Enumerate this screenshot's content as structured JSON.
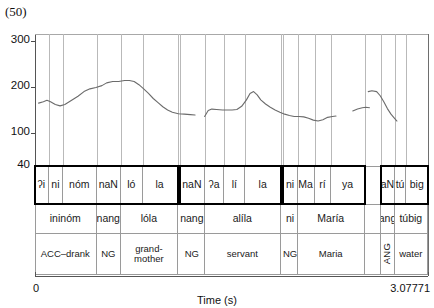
{
  "figure": {
    "example_number": "(50)",
    "x_axis_title": "Time (s)",
    "x_min_label": "0",
    "x_max_label": "3.07771",
    "y_ticks": [
      "300",
      "200",
      "100",
      "40"
    ],
    "grid": true,
    "line_color": "#6b6b6b"
  },
  "chart_data": {
    "type": "line",
    "title": "(50)",
    "xlabel": "Time (s)",
    "ylabel": "",
    "xlim": [
      0,
      3.07771
    ],
    "ylim": [
      40,
      300
    ],
    "yticks": [
      40,
      100,
      200,
      300
    ],
    "grid": "vertical gridlines at segment boundaries",
    "legend": "none",
    "series": [
      {
        "name": "F0 contour (Hz)",
        "points": [
          [
            0.03,
            165
          ],
          [
            0.07,
            168
          ],
          [
            0.1,
            171
          ],
          [
            0.13,
            168
          ],
          [
            0.17,
            162
          ],
          [
            0.21,
            159
          ],
          [
            0.25,
            162
          ],
          [
            0.3,
            170
          ],
          [
            0.36,
            180
          ],
          [
            0.41,
            190
          ],
          [
            0.46,
            196
          ],
          [
            0.51,
            199
          ],
          [
            0.56,
            203
          ],
          [
            0.6,
            209
          ],
          [
            0.65,
            212
          ],
          [
            0.7,
            212
          ],
          [
            0.75,
            214
          ],
          [
            0.79,
            214
          ],
          [
            0.83,
            212
          ],
          [
            0.87,
            205
          ],
          [
            0.91,
            196
          ],
          [
            0.95,
            186
          ],
          [
            0.99,
            175
          ],
          [
            1.03,
            166
          ],
          [
            1.07,
            157
          ],
          [
            1.11,
            150
          ],
          [
            1.15,
            145
          ],
          [
            1.2,
            142
          ],
          [
            1.25,
            141
          ],
          [
            1.3,
            140
          ],
          [
            1.34,
            139
          ]
        ]
      },
      {
        "name": "F0 contour segment 2 (Hz)",
        "points": [
          [
            1.42,
            136
          ],
          [
            1.45,
            149
          ],
          [
            1.48,
            152
          ],
          [
            1.52,
            151
          ],
          [
            1.57,
            150
          ],
          [
            1.61,
            150
          ],
          [
            1.65,
            150
          ],
          [
            1.69,
            151
          ],
          [
            1.73,
            158
          ],
          [
            1.77,
            172
          ],
          [
            1.8,
            186
          ],
          [
            1.83,
            190
          ],
          [
            1.86,
            183
          ],
          [
            1.89,
            172
          ],
          [
            1.93,
            163
          ],
          [
            1.97,
            156
          ],
          [
            2.01,
            150
          ],
          [
            2.05,
            145
          ],
          [
            2.09,
            141
          ],
          [
            2.13,
            138
          ],
          [
            2.17,
            136
          ],
          [
            2.21,
            136
          ],
          [
            2.25,
            135
          ],
          [
            2.29,
            132
          ],
          [
            2.33,
            128
          ],
          [
            2.37,
            126
          ],
          [
            2.41,
            129
          ],
          [
            2.45,
            134
          ],
          [
            2.49,
            136
          ],
          [
            2.52,
            137
          ]
        ]
      },
      {
        "name": "F0 contour segment 3 (Hz)",
        "points": [
          [
            2.66,
            148
          ],
          [
            2.7,
            152
          ],
          [
            2.74,
            155
          ],
          [
            2.77,
            156
          ],
          [
            2.8,
            155
          ]
        ]
      },
      {
        "name": "F0 contour segment 4 (Hz)",
        "points": [
          [
            2.79,
            190
          ],
          [
            2.82,
            192
          ],
          [
            2.86,
            190
          ],
          [
            2.89,
            181
          ],
          [
            2.92,
            168
          ],
          [
            2.95,
            153
          ],
          [
            2.98,
            141
          ],
          [
            3.01,
            132
          ],
          [
            3.03,
            126
          ]
        ]
      }
    ]
  },
  "tiers": {
    "syllables": [
      {
        "label": "ʔi",
        "start": 0.0,
        "end": 0.115,
        "bold": true
      },
      {
        "label": "ni",
        "start": 0.115,
        "end": 0.235,
        "bold": true
      },
      {
        "label": "nóm",
        "start": 0.235,
        "end": 0.515,
        "bold": true
      },
      {
        "label": "naN",
        "start": 0.515,
        "end": 0.72,
        "bold": true
      },
      {
        "label": "ló",
        "start": 0.72,
        "end": 0.9,
        "bold": true
      },
      {
        "label": "la",
        "start": 0.9,
        "end": 1.195,
        "bold": true
      },
      {
        "label": "naN",
        "start": 1.215,
        "end": 1.42,
        "bold": true
      },
      {
        "label": "ʔa",
        "start": 1.42,
        "end": 1.585,
        "bold": true
      },
      {
        "label": "lí",
        "start": 1.585,
        "end": 1.76,
        "bold": true
      },
      {
        "label": "la",
        "start": 1.76,
        "end": 2.06,
        "bold": true
      },
      {
        "label": "ni",
        "start": 2.08,
        "end": 2.2,
        "bold": true
      },
      {
        "label": "Ma",
        "start": 2.2,
        "end": 2.34,
        "bold": true
      },
      {
        "label": "rí",
        "start": 2.34,
        "end": 2.48,
        "bold": true
      },
      {
        "label": "ya",
        "start": 2.48,
        "end": 2.76,
        "bold": true
      },
      {
        "label": "",
        "start": 2.76,
        "end": 2.9,
        "bold": false
      },
      {
        "label": "aN",
        "start": 2.9,
        "end": 3.01,
        "bold": true
      },
      {
        "label": "tú",
        "start": 3.01,
        "end": 3.11,
        "bold": true
      },
      {
        "label": "big",
        "start": 3.11,
        "end": 3.29,
        "bold": true
      }
    ],
    "words": [
      {
        "label": "ininóm",
        "start": 0.0,
        "end": 0.515
      },
      {
        "label": "nang",
        "start": 0.515,
        "end": 0.72
      },
      {
        "label": "lóla",
        "start": 0.72,
        "end": 1.195
      },
      {
        "label": "nang",
        "start": 1.215,
        "end": 1.42
      },
      {
        "label": "alíla",
        "start": 1.42,
        "end": 2.06
      },
      {
        "label": "ni",
        "start": 2.08,
        "end": 2.2
      },
      {
        "label": "María",
        "start": 2.2,
        "end": 2.76
      },
      {
        "label": "",
        "start": 2.76,
        "end": 2.9
      },
      {
        "label": "ang",
        "start": 2.9,
        "end": 3.01
      },
      {
        "label": "túbig",
        "start": 3.01,
        "end": 3.29
      }
    ],
    "gloss": [
      {
        "label": "ACC–drank",
        "start": 0.0,
        "end": 0.515,
        "rotated": false
      },
      {
        "label": "NG",
        "start": 0.515,
        "end": 0.72,
        "rotated": false
      },
      {
        "label": "grand-mother",
        "start": 0.72,
        "end": 1.195,
        "rotated": false
      },
      {
        "label": "NG",
        "start": 1.215,
        "end": 1.42,
        "rotated": false
      },
      {
        "label": "servant",
        "start": 1.42,
        "end": 2.06,
        "rotated": false
      },
      {
        "label": "NG",
        "start": 2.08,
        "end": 2.2,
        "rotated": false
      },
      {
        "label": "Maria",
        "start": 2.2,
        "end": 2.76,
        "rotated": false
      },
      {
        "label": "",
        "start": 2.76,
        "end": 2.9,
        "rotated": false
      },
      {
        "label": "ANG",
        "start": 2.9,
        "end": 3.01,
        "rotated": true
      },
      {
        "label": "water",
        "start": 3.01,
        "end": 3.29,
        "rotated": false
      }
    ],
    "bold_groups": [
      {
        "start": 0.0,
        "end": 1.195
      },
      {
        "start": 1.215,
        "end": 2.06
      },
      {
        "start": 2.08,
        "end": 2.76
      },
      {
        "start": 2.9,
        "end": 3.29
      }
    ]
  }
}
